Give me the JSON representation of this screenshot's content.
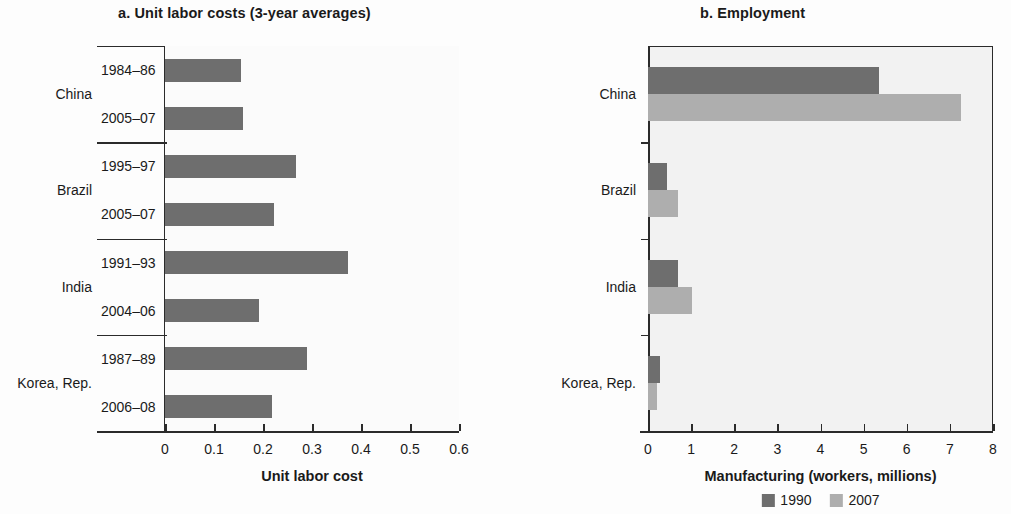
{
  "chart_data": [
    {
      "type": "bar",
      "panel": "a",
      "title": "a.  Unit labor costs (3-year averages)",
      "xlabel": "Unit labor cost",
      "ylabel": "",
      "orientation": "horizontal",
      "xlim": [
        0,
        0.6
      ],
      "xticks": [
        "0",
        "0.1",
        "0.2",
        "0.3",
        "0.4",
        "0.5",
        "0.6"
      ],
      "xtick_values": [
        0,
        0.1,
        0.2,
        0.3,
        0.4,
        0.5,
        0.6
      ],
      "grid": false,
      "legend": "none",
      "bar_color": "#6e6e6e",
      "groups": [
        {
          "country": "China",
          "bars": [
            {
              "period": "1984–86",
              "value": 0.155
            },
            {
              "period": "2005–07",
              "value": 0.16
            }
          ]
        },
        {
          "country": "Brazil",
          "bars": [
            {
              "period": "1995–97",
              "value": 0.268
            },
            {
              "period": "2005–07",
              "value": 0.222
            }
          ]
        },
        {
          "country": "India",
          "bars": [
            {
              "period": "1991–93",
              "value": 0.373
            },
            {
              "period": "2004–06",
              "value": 0.192
            }
          ]
        },
        {
          "country": "Korea, Rep.",
          "bars": [
            {
              "period": "1987–89",
              "value": 0.29
            },
            {
              "period": "2006–08",
              "value": 0.218
            }
          ]
        }
      ]
    },
    {
      "type": "bar",
      "panel": "b",
      "title": "b.  Employment",
      "xlabel": "Manufacturing (workers, millions)",
      "ylabel": "",
      "orientation": "horizontal",
      "xlim": [
        0,
        8
      ],
      "xticks": [
        "0",
        "1",
        "2",
        "3",
        "4",
        "5",
        "6",
        "7",
        "8"
      ],
      "xtick_values": [
        0,
        1,
        2,
        3,
        4,
        5,
        6,
        7,
        8
      ],
      "grid": false,
      "legend_position": "bottom",
      "categories": [
        "China",
        "Brazil",
        "India",
        "Korea, Rep."
      ],
      "series": [
        {
          "name": "1990",
          "color": "#6e6e6e",
          "values": [
            5.35,
            0.43,
            0.7,
            0.28
          ]
        },
        {
          "name": "2007",
          "color": "#aeaeae",
          "values": [
            7.25,
            0.7,
            1.02,
            0.2
          ]
        }
      ]
    }
  ]
}
